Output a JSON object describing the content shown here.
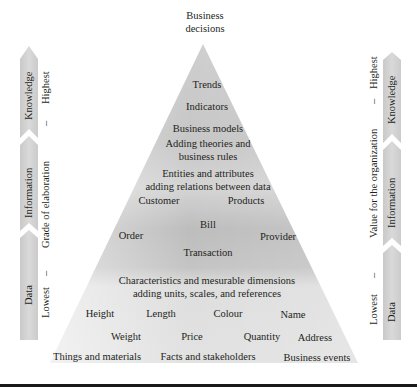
{
  "diagram": {
    "type": "pyramid",
    "apex_label": "Business\ndecisions",
    "apex_lines": [
      "Business",
      "decisions"
    ],
    "levels": {
      "knowledge": {
        "items": [
          "Trends",
          "Indicators",
          "Business models"
        ],
        "description_lines": [
          "Adding theories and",
          "business rules"
        ]
      },
      "information": {
        "description_lines": [
          "Entities and attributes",
          "adding relations between data"
        ],
        "items": [
          "Customer",
          "Products",
          "Bill",
          "Order",
          "Provider",
          "Transaction"
        ]
      },
      "data": {
        "description_lines": [
          "Characteristics and mesurable dimensions",
          "adding units, scales, and references"
        ],
        "items_row1": [
          "Height",
          "Length",
          "Colour",
          "Name"
        ],
        "items_row2": [
          "Weight",
          "Price",
          "Quantity",
          "Address"
        ]
      }
    },
    "base_labels": [
      "Things and materials",
      "Facts and stakeholders",
      "Business events"
    ],
    "left_axis": {
      "title": "Grade of elaboration",
      "low": "Lowest",
      "high": "Highest",
      "dash": "–",
      "segments": [
        "Data",
        "Information",
        "Knowledge"
      ]
    },
    "right_axis": {
      "title": "Value for the organization",
      "low": "Lowest",
      "high": "Highest",
      "dash": "–",
      "segments": [
        "Data",
        "Information",
        "Knowledge"
      ]
    },
    "colors": {
      "pyramid_light": "#e4e4e4",
      "pyramid_mid": "#b8b8b8",
      "arrow_fill": "#d2d2d2",
      "text": "#231f20",
      "rule": "#1a1a1a"
    }
  }
}
